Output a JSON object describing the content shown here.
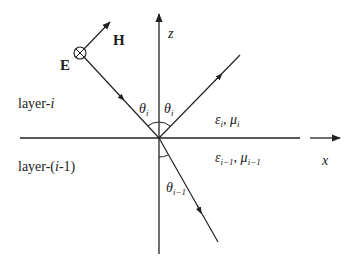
{
  "diagram": {
    "type": "plane-wave-incidence-at-layer-interface",
    "axes": {
      "x_label": "x",
      "z_label": "z"
    },
    "field_labels": {
      "electric": "E",
      "magnetic": "H"
    },
    "regions": {
      "upper": {
        "name_prefix": "layer-",
        "name_index": "i",
        "epsilon": "ε",
        "epsilon_sub": "i",
        "mu": "μ",
        "mu_sub": "i",
        "separator": ", "
      },
      "lower": {
        "name_prefix": "layer-(",
        "name_index": "i",
        "name_suffix": "-1)",
        "epsilon": "ε",
        "epsilon_sub": "i−1",
        "mu": "μ",
        "mu_sub": "i−1",
        "separator": ", "
      }
    },
    "angles": {
      "incident": {
        "symbol": "θ",
        "sub": "i"
      },
      "reflected": {
        "symbol": "θ",
        "sub": "i"
      },
      "transmitted": {
        "symbol": "θ",
        "sub": "i−1"
      }
    },
    "rays": [
      "incident",
      "reflected",
      "transmitted"
    ],
    "colors": {
      "line": "#222222",
      "background": "#ffffff"
    }
  }
}
